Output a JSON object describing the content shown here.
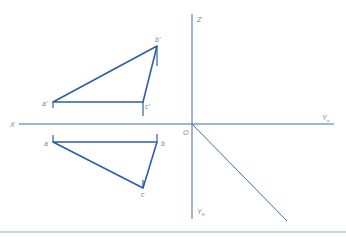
{
  "colors": {
    "line": "#2b5fa6",
    "axis": "#3c6db0",
    "label": "#7a8796",
    "rule": "#8eaed0"
  },
  "axes": {
    "x_label": "X",
    "z_label": "Z",
    "origin_label": "O",
    "yw_label": "Y",
    "yw_sub": "w",
    "yh_label": "Y",
    "yh_sub": "H"
  },
  "front_view": {
    "points": [
      {
        "label": "a'",
        "x": 53,
        "y": 102
      },
      {
        "label": "b'",
        "x": 157,
        "y": 46
      },
      {
        "label": "c'",
        "x": 143,
        "y": 102
      }
    ]
  },
  "top_view": {
    "points": [
      {
        "label": "a",
        "x": 53,
        "y": 142
      },
      {
        "label": "b",
        "x": 157,
        "y": 142
      },
      {
        "label": "c",
        "x": 143,
        "y": 188
      }
    ]
  }
}
